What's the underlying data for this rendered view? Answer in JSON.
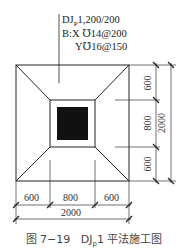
{
  "annotation": {
    "line1": "DJ",
    "line1_sub": "P",
    "line1_rest": "1,200/200",
    "line2": "B:X ℧14@200",
    "line3": "Y℧16@150"
  },
  "dimensions": {
    "right": [
      "600",
      "800",
      "600"
    ],
    "right_total": "2000",
    "bottom": [
      "600",
      "800",
      "600"
    ],
    "bottom_total": "2000"
  },
  "caption": {
    "figure": "图 7−19",
    "title_pre": "DJ",
    "title_sub": "p",
    "title_post": "1 平法施工图"
  },
  "colors": {
    "line": "#222222",
    "column_fill": "#111111"
  }
}
